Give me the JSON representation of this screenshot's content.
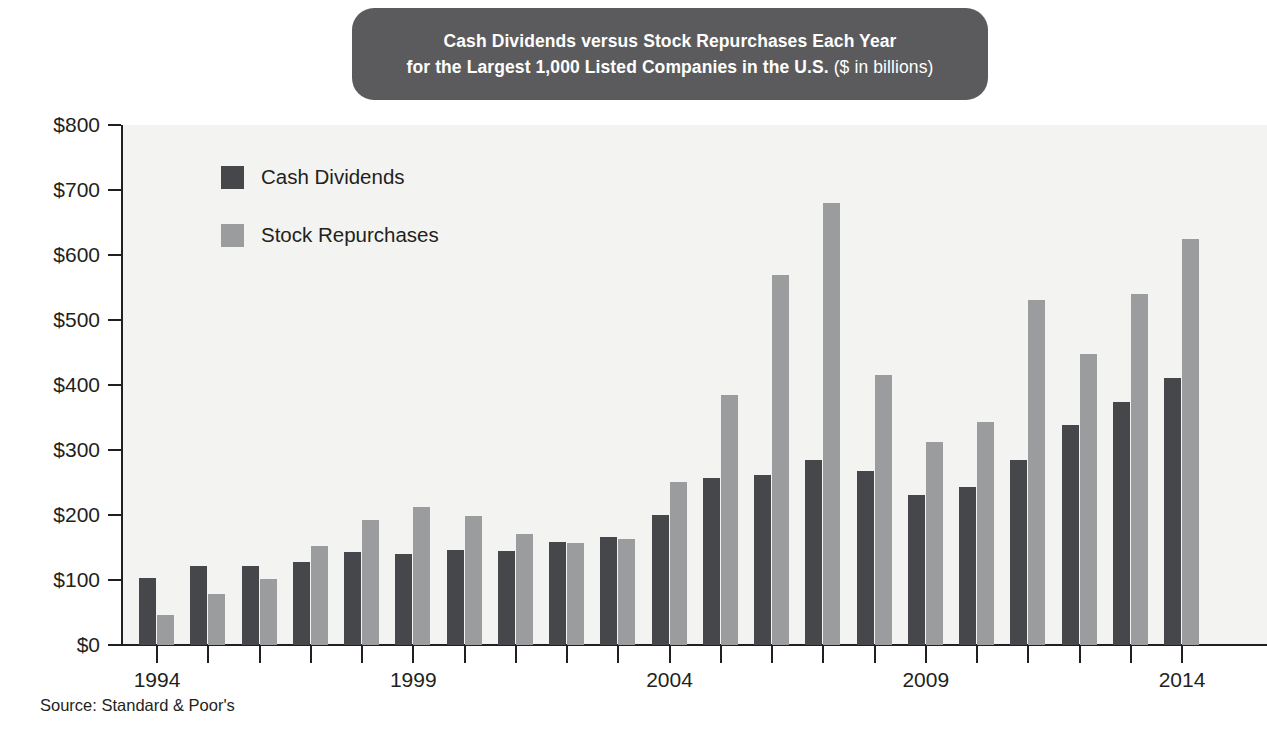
{
  "title": {
    "line1": "Cash Dividends versus Stock Repurchases Each Year",
    "line2_bold": "for the Largest 1,000 Listed Companies in the U.S.",
    "line2_thin": " ($ in billions)"
  },
  "legend": {
    "position": "inside-top-left",
    "items": [
      {
        "label": "Cash Dividends",
        "color": "#45474b",
        "key": "dividends"
      },
      {
        "label": "Stock Repurchases",
        "color": "#9b9c9e",
        "key": "repurchases"
      }
    ]
  },
  "source_note": "Source: Standard & Poor's",
  "colors": {
    "dividends": "#45474b",
    "repurchases": "#9b9c9e",
    "title_pill": "#5b5b5d",
    "title_text": "#ffffff",
    "plot_background": "#f3f3f1",
    "axis": "#231f20",
    "page_background": "#ffffff"
  },
  "chart_data": {
    "type": "bar",
    "title": "Cash Dividends versus Stock Repurchases Each Year for the Largest 1,000 Listed Companies in the U.S. ($ in billions)",
    "subtitle": "",
    "xlabel": "",
    "ylabel": "",
    "unit": "$ in billions",
    "grid": false,
    "legend_position": "inside-top-left",
    "ylim": [
      0,
      800
    ],
    "ytick_values": [
      0,
      100,
      200,
      300,
      400,
      500,
      600,
      700,
      800
    ],
    "ytick_labels": [
      "$0",
      "$100",
      "$200",
      "$300",
      "$400",
      "$500",
      "$600",
      "$700",
      "$800"
    ],
    "categories": [
      "1994",
      "1995",
      "1996",
      "1997",
      "1998",
      "1999",
      "2000",
      "2001",
      "2002",
      "2003",
      "2004",
      "2005",
      "2006",
      "2007",
      "2008",
      "2009",
      "2010",
      "2011",
      "2012",
      "2013",
      "2014"
    ],
    "xtick_labels_shown": [
      "1994",
      "1999",
      "2004",
      "2009",
      "2014"
    ],
    "series": [
      {
        "name": "Cash Dividends",
        "color": "#45474b",
        "values": [
          103,
          122,
          122,
          127,
          143,
          140,
          146,
          144,
          158,
          166,
          200,
          257,
          262,
          284,
          268,
          231,
          243,
          284,
          338,
          374,
          411
        ]
      },
      {
        "name": "Stock Repurchases",
        "color": "#9b9c9e",
        "values": [
          46,
          79,
          101,
          153,
          193,
          212,
          198,
          171,
          157,
          163,
          251,
          385,
          570,
          680,
          415,
          313,
          343,
          531,
          447,
          540,
          625
        ]
      }
    ]
  }
}
